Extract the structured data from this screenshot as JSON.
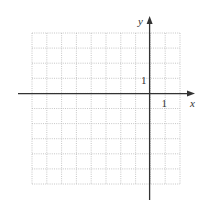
{
  "figure": {
    "type": "coordinate-grid",
    "grid": {
      "columns": 10,
      "rows": 10,
      "x_min": -6,
      "x_max": 2,
      "y_min": -5,
      "y_max": 3,
      "line_style": "dotted",
      "line_color": "#b8b8b8"
    },
    "axes": {
      "x_label": "x",
      "y_label": "y",
      "x_tick_label": "1",
      "y_tick_label": "1",
      "axis_color": "#333333"
    }
  }
}
